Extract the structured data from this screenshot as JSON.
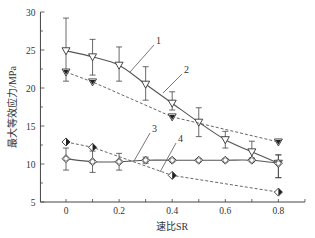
{
  "chart_data": {
    "type": "line",
    "title": "",
    "xlabel": "速比SR",
    "ylabel": "最大等效应力/MPa",
    "xlim": [
      -0.1,
      0.9
    ],
    "ylim": [
      5,
      30
    ],
    "xticks": [
      0,
      0.2,
      0.4,
      0.6,
      0.8
    ],
    "xtick_labels": [
      "0",
      "0.2",
      "0.4",
      "0.6",
      "0.8"
    ],
    "yticks": [
      5,
      10,
      15,
      20,
      25,
      30
    ],
    "ytick_labels": [
      "5",
      "10",
      "15",
      "20",
      "25",
      "30"
    ],
    "grid": false,
    "legend": "none (curves labeled 1–4 with leader lines)",
    "x": [
      0,
      0.1,
      0.2,
      0.3,
      0.4,
      0.5,
      0.6,
      0.7,
      0.8
    ],
    "series": [
      {
        "name": "1",
        "marker": "open-down-triangle",
        "line": "solid",
        "values": [
          24.9,
          24.1,
          23.0,
          20.5,
          18.0,
          15.5,
          13.2,
          11.6,
          10.1
        ],
        "err_high": [
          29.2,
          26.4,
          25.4,
          22.8,
          19.5,
          17.4,
          14.3,
          13.0,
          11.2
        ],
        "err_low": [
          20.9,
          21.7,
          20.9,
          18.4,
          17.1,
          13.6,
          12.1,
          10.8,
          8.2
        ]
      },
      {
        "name": "2",
        "marker": "filled-down-triangle",
        "line": "dashed",
        "x": [
          0,
          0.1,
          0.4,
          0.8
        ],
        "values": [
          22.1,
          20.8,
          16.2,
          12.9
        ]
      },
      {
        "name": "3",
        "marker": "open-diamond-circle",
        "line": "solid",
        "values": [
          10.7,
          10.3,
          10.3,
          10.5,
          10.5,
          10.5,
          10.5,
          10.5,
          10.1
        ],
        "err_high": [
          12.1,
          11.7,
          11.4,
          10.9,
          10.7,
          10.7,
          10.7,
          10.7,
          11.2
        ],
        "err_low": [
          9.2,
          8.9,
          9.2,
          10.1,
          10.3,
          10.3,
          10.3,
          10.3,
          8.2
        ]
      },
      {
        "name": "4",
        "marker": "half-filled-diamond",
        "line": "dashed",
        "x": [
          0,
          0.1,
          0.4,
          0.8
        ],
        "values": [
          12.9,
          12.2,
          8.5,
          6.3
        ]
      }
    ],
    "annotations": [
      {
        "text": "1",
        "x": 156,
        "y": 46,
        "line_to": [
          130,
          72
        ]
      },
      {
        "text": "2",
        "x": 184,
        "y": 75,
        "line_to": [
          163,
          93
        ]
      },
      {
        "text": "3",
        "x": 152,
        "y": 134,
        "line_to": [
          134,
          161
        ]
      },
      {
        "text": "4",
        "x": 178,
        "y": 144,
        "line_to": [
          160,
          172
        ]
      }
    ]
  },
  "colors": {
    "axis": "#444444",
    "line": "#555555",
    "text": "#333333"
  }
}
